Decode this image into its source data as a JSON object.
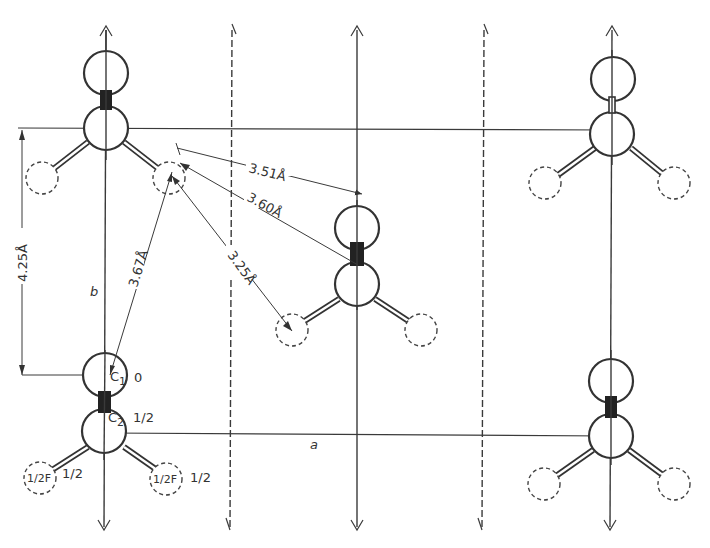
{
  "figure": {
    "axes": {
      "a_label": "a",
      "b_label": "b"
    },
    "distances": {
      "d1": "3.51Å",
      "d2": "3.60Å",
      "d3": "3.25Å",
      "d4": "3.67Å",
      "cell_b": "4.25Å"
    },
    "atom_labels": {
      "c1": "C",
      "c1_sub": "1",
      "c2": "C",
      "c2_sub": "2",
      "f_left": "1/2F",
      "f_right": "1/2F"
    },
    "heights": {
      "c1_height": "0",
      "c2_height": "1/2",
      "f_left_height": "1/2",
      "f_right_height": "1/2"
    },
    "symmetry_axes": [
      {
        "x": 106,
        "type": "solid"
      },
      {
        "x": 232,
        "type": "dashed"
      },
      {
        "x": 357,
        "type": "solid"
      },
      {
        "x": 484,
        "type": "dashed"
      },
      {
        "x": 610,
        "type": "solid"
      }
    ],
    "colors": {
      "ink": "#333333",
      "background": "#ffffff"
    }
  }
}
